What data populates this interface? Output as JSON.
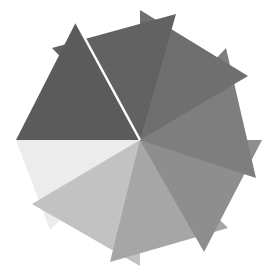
{
  "figure": {
    "background": "#ffffff",
    "center": [
      140,
      140
    ],
    "triangles": [
      {
        "name": "triangle-1-dark-left-upper",
        "fill": "#5b5b5b",
        "points": "76,22 16,140 140,140"
      },
      {
        "name": "triangle-2-top",
        "fill": "#626262",
        "points": "52,48 176,14 140,140"
      },
      {
        "name": "triangle-3-top-right",
        "fill": "#6f6f6f",
        "points": "140,10 248,76 140,140"
      },
      {
        "name": "triangle-4-right",
        "fill": "#7e7e7e",
        "points": "226,48 256,178 140,140"
      },
      {
        "name": "triangle-5-lower-right",
        "fill": "#8e8e8e",
        "points": "262,140 204,252 140,140"
      },
      {
        "name": "triangle-6-bottom",
        "fill": "#a6a6a6",
        "points": "228,228 110,262 140,140"
      },
      {
        "name": "triangle-7-lower-left",
        "fill": "#c2c2c2",
        "points": "140,266 32,204 140,140"
      },
      {
        "name": "triangle-8-left-light",
        "fill": "#ececec",
        "points": "16,140 50,230 140,140"
      }
    ],
    "highlight_stroke": "#ffffff"
  }
}
